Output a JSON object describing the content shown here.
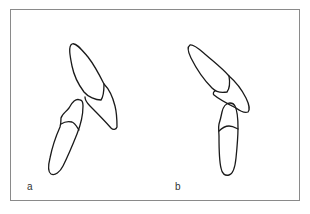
{
  "figure": {
    "panels": [
      {
        "id": "a",
        "label": "a",
        "description": "Two tooth outlines: upper crown with root segment overlapping, lower tooth tilted with cemento-enamel line"
      },
      {
        "id": "b",
        "label": "b",
        "description": "Upper tooth crown tilted left with root segment, lower tooth vertical with cemento-enamel line"
      }
    ],
    "frame_color": "#8a8a8a",
    "stroke_color": "#1a1a1a",
    "label_color": "#333333"
  },
  "caption": {
    "text": ""
  }
}
